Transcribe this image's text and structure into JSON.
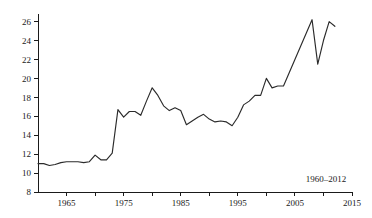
{
  "chart_data": {
    "type": "line",
    "title": "",
    "subtitle": "",
    "xlabel": "",
    "ylabel": "",
    "annotation": "1960–2012",
    "grid": false,
    "legend": false,
    "legend_position": "none",
    "xlim": [
      1960,
      2015
    ],
    "ylim": [
      8,
      26.8
    ],
    "x_ticks_major": [
      1965,
      1975,
      1985,
      1995,
      2005,
      2015
    ],
    "x_ticks_minor": [
      1970,
      1980,
      1990,
      2000,
      2010
    ],
    "x_tick_labels": [
      "1965",
      "1975",
      "1985",
      "1995",
      "2005",
      "2015"
    ],
    "y_ticks": [
      8,
      10,
      12,
      14,
      16,
      18,
      20,
      22,
      24,
      26
    ],
    "y_tick_labels": [
      "8",
      "10",
      "12",
      "14",
      "16",
      "18",
      "20",
      "22",
      "24",
      "26"
    ],
    "line_color": "#2b2b2b",
    "axis_color": "#1a1a1a",
    "background_color": "#ffffff",
    "x": [
      1960,
      1961,
      1962,
      1963,
      1964,
      1965,
      1966,
      1967,
      1968,
      1969,
      1970,
      1971,
      1972,
      1973,
      1974,
      1975,
      1976,
      1977,
      1978,
      1979,
      1980,
      1981,
      1982,
      1983,
      1984,
      1985,
      1986,
      1987,
      1988,
      1989,
      1990,
      1991,
      1992,
      1993,
      1994,
      1995,
      1996,
      1997,
      1998,
      1999,
      2000,
      2001,
      2002,
      2003,
      2004,
      2005,
      2006,
      2007,
      2008,
      2009,
      2010,
      2011,
      2012
    ],
    "values": [
      11.0,
      11.0,
      10.8,
      10.9,
      11.1,
      11.2,
      11.2,
      11.2,
      11.1,
      11.2,
      11.9,
      11.4,
      11.4,
      12.1,
      16.7,
      15.9,
      16.5,
      16.5,
      16.1,
      17.6,
      19.0,
      18.2,
      17.1,
      16.6,
      16.9,
      16.6,
      15.1,
      15.5,
      15.9,
      16.2,
      15.7,
      15.4,
      15.5,
      15.4,
      15.0,
      15.9,
      17.2,
      17.6,
      18.2,
      18.2,
      20.0,
      19.0,
      19.2,
      19.2,
      20.6,
      22.0,
      23.4,
      24.8,
      26.2,
      21.5,
      24.0,
      26.0,
      25.5
    ],
    "series_name": "value"
  }
}
